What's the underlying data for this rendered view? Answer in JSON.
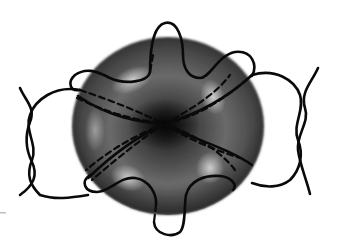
{
  "figure": {
    "title": "Disc-shaped cell with looping strands",
    "background": "#ffffff",
    "cell": {
      "shape": "biconcave-disc",
      "fill_light": "#9a9a9a",
      "fill_mid": "#5c5c5c",
      "fill_dark": "#161616",
      "highlight": "#c8c8c8"
    },
    "strands": {
      "color": "#0a0a0a",
      "style_front": "solid",
      "style_back": "dashed",
      "count_loops": 4,
      "braids": [
        "left",
        "right"
      ]
    }
  }
}
